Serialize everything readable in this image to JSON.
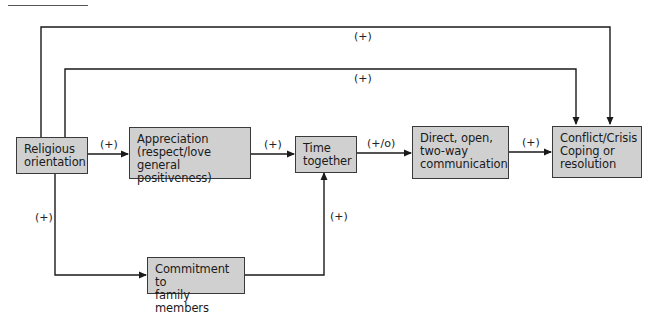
{
  "diagram": {
    "type": "path-diagram",
    "nodes": [
      {
        "id": "religious",
        "lines": [
          "Religious",
          "orientation"
        ]
      },
      {
        "id": "appreciation",
        "lines": [
          "Appreciation",
          "(respect/love",
          "general positiveness)"
        ]
      },
      {
        "id": "time",
        "lines": [
          "Time",
          "together"
        ]
      },
      {
        "id": "communication",
        "lines": [
          "Direct, open,",
          "two-way",
          "communication"
        ]
      },
      {
        "id": "conflict",
        "lines": [
          "Conflict/Crisis",
          "Coping or",
          "resolution"
        ]
      },
      {
        "id": "commitment",
        "lines": [
          "Commitment to",
          "family members"
        ]
      }
    ],
    "edges": [
      {
        "from": "religious",
        "to": "conflict",
        "label": "(+)",
        "route": "outer-top"
      },
      {
        "from": "religious",
        "to": "conflict",
        "label": "(+)",
        "route": "inner-top"
      },
      {
        "from": "religious",
        "to": "appreciation",
        "label": "(+)"
      },
      {
        "from": "appreciation",
        "to": "time",
        "label": "(+)"
      },
      {
        "from": "time",
        "to": "communication",
        "label": "(+/o)"
      },
      {
        "from": "communication",
        "to": "conflict",
        "label": "(+)"
      },
      {
        "from": "religious",
        "to": "commitment",
        "label": "(+)"
      },
      {
        "from": "commitment",
        "to": "time",
        "label": "(+)"
      }
    ],
    "colors": {
      "box_fill": "#d0d0d0",
      "box_border": "#3a3a3a",
      "line": "#1a1a1a"
    }
  }
}
